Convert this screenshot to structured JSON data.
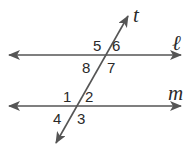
{
  "diagram": {
    "type": "parallel-lines-transversal",
    "lines": {
      "l": {
        "label": "ℓ",
        "y": 55,
        "x1": 8,
        "x2": 182
      },
      "m": {
        "label": "m",
        "y": 106,
        "x1": 8,
        "x2": 182
      },
      "t": {
        "label": "t",
        "x1": 55,
        "y1": 145,
        "x2": 129,
        "y2": 14
      }
    },
    "angles": {
      "a1": "1",
      "a2": "2",
      "a3": "3",
      "a4": "4",
      "a5": "5",
      "a6": "6",
      "a7": "7",
      "a8": "8"
    },
    "colors": {
      "line": "#555555",
      "text": "#2a2a2a"
    }
  }
}
